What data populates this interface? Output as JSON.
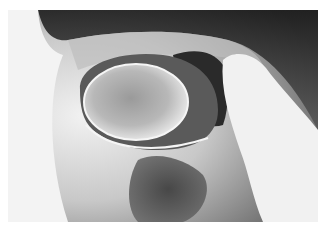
{
  "image": {
    "kind": "grayscale photograph",
    "subject": "endoscopic view with rounded translucent mass and pale instrument",
    "colors": {
      "background": "#ffffff",
      "dark_region": "#1a1a1a",
      "mid_gray": "#8a8a8a",
      "light": "#ededed"
    }
  }
}
